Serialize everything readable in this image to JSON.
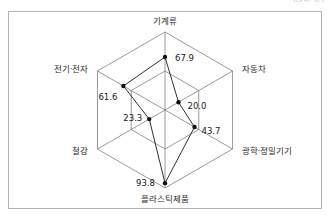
{
  "figure": {
    "clipped_unit_note": "(단위: %)"
  },
  "chart_data": {
    "type": "radar",
    "title": "",
    "subtitle": "",
    "xlabel": "",
    "ylabel": "",
    "grid": true,
    "legend": "none",
    "rmin": 0,
    "rmax": 100,
    "categories": [
      "기계류",
      "자동차",
      "광학·정밀기기",
      "플라스틱제품",
      "철강",
      "전기·전자"
    ],
    "values": [
      67.9,
      20.0,
      43.7,
      93.8,
      23.3,
      61.6
    ],
    "value_labels": [
      "67.9",
      "20.0",
      "43.7",
      "93.8",
      "23.3",
      "61.6"
    ],
    "series": [
      {
        "name": "",
        "values": [
          67.9,
          20.0,
          43.7,
          93.8,
          23.3,
          61.6
        ]
      }
    ],
    "axis_labels": {
      "top": "기계류",
      "top_right": "자동차",
      "bottom_right": "광학·정밀기기",
      "bottom": "플라스틱제품",
      "bottom_left": "철강",
      "top_left": "전기·전자"
    },
    "colors": {
      "series_line": "#1a1a1a",
      "series_point": "#111111",
      "grid": "#6e6e6e",
      "frame": "#b4b4b4",
      "text": "#2b2b2b",
      "background": "#ffffff"
    }
  }
}
